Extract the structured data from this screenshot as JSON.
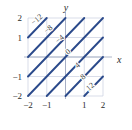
{
  "figure": {
    "name": "level-curves-contour-plot",
    "colors": {
      "contour": "#2b4a8b",
      "grid": "#c9cfe0",
      "axis": "#9aa3bb",
      "text": "#2b2b2b",
      "background": "#ffffff"
    }
  },
  "axes": {
    "x_name": "x",
    "y_name": "y",
    "x_ticks": [
      {
        "value": -2,
        "label": "−2"
      },
      {
        "value": -1,
        "label": "−1"
      },
      {
        "value": 1,
        "label": "1"
      },
      {
        "value": 2,
        "label": "2"
      }
    ],
    "y_ticks": [
      {
        "value": 2,
        "label": "2"
      },
      {
        "value": 1,
        "label": "1"
      },
      {
        "value": -1,
        "label": "−1"
      },
      {
        "value": -2,
        "label": "−2"
      }
    ]
  },
  "chart_data": {
    "type": "line",
    "title": "",
    "subtitle": "",
    "xlabel": "x",
    "ylabel": "y",
    "xlim": [
      -2,
      2
    ],
    "ylim": [
      -2,
      2
    ],
    "grid": true,
    "legend": "none",
    "plot_kind": "contour-level-curves",
    "contour_levels": [
      -12,
      -8,
      -4,
      0,
      4,
      8,
      12
    ],
    "contour_labels": [
      {
        "level": -12,
        "label": "−12",
        "x": -1.45,
        "y": 1.82,
        "rotation": -40
      },
      {
        "level": -8,
        "label": "−8",
        "x": -0.83,
        "y": 1.33,
        "rotation": -40
      },
      {
        "level": -4,
        "label": "−4",
        "x": -0.22,
        "y": 0.82,
        "rotation": -40
      },
      {
        "level": 0,
        "label": "0",
        "x": 0.22,
        "y": 0.17,
        "rotation": -40
      },
      {
        "level": 4,
        "label": "4",
        "x": 0.72,
        "y": -0.52,
        "rotation": -40
      },
      {
        "level": 8,
        "label": "8",
        "x": 1.02,
        "y": -1.12,
        "rotation": -40
      },
      {
        "level": 12,
        "label": "12",
        "x": 1.4,
        "y": -1.62,
        "rotation": -40
      }
    ],
    "series": [
      {
        "name": "level -12",
        "level": -12,
        "x": [
          -2.0,
          -1.0
        ],
        "y": [
          1.0,
          2.0
        ]
      },
      {
        "name": "level -8",
        "level": -8,
        "x": [
          -2.0,
          0.0
        ],
        "y": [
          0.0,
          2.0
        ]
      },
      {
        "name": "level -4",
        "level": -4,
        "x": [
          -2.0,
          1.0
        ],
        "y": [
          -1.0,
          2.0
        ]
      },
      {
        "name": "level 0",
        "level": 0,
        "x": [
          -2.0,
          2.0
        ],
        "y": [
          -2.0,
          2.0
        ]
      },
      {
        "name": "level 4",
        "level": 4,
        "x": [
          -1.0,
          2.0
        ],
        "y": [
          -2.0,
          1.0
        ]
      },
      {
        "name": "level 8",
        "level": 8,
        "x": [
          0.0,
          2.0
        ],
        "y": [
          -2.0,
          0.0
        ]
      },
      {
        "name": "level 12",
        "level": 12,
        "x": [
          1.0,
          2.0
        ],
        "y": [
          -2.0,
          -1.0
        ]
      }
    ],
    "grid_lines_x": [
      -2,
      -1,
      0,
      1,
      2
    ],
    "grid_lines_y": [
      -2,
      -1,
      0,
      1,
      2
    ]
  }
}
